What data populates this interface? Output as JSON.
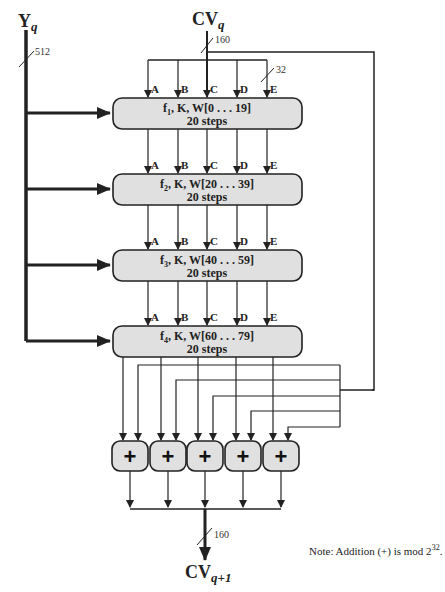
{
  "diagram": {
    "inputs": {
      "message_block": {
        "label": "Y",
        "subscript": "q",
        "width": "512"
      },
      "chaining_in": {
        "label": "CV",
        "subscript": "q",
        "width": "160"
      }
    },
    "register_width": "32",
    "registers": [
      "A",
      "B",
      "C",
      "D",
      "E"
    ],
    "rounds": [
      {
        "func": "f",
        "sub": "1",
        "rest": ", K, W[0 . . . 19]",
        "steps": "20 steps"
      },
      {
        "func": "f",
        "sub": "2",
        "rest": ", K, W[20 . . . 39]",
        "steps": "20 steps"
      },
      {
        "func": "f",
        "sub": "3",
        "rest": ", K, W[40 . . . 59]",
        "steps": "20 steps"
      },
      {
        "func": "f",
        "sub": "4",
        "rest": ", K, W[60 . . . 79]",
        "steps": "20 steps"
      }
    ],
    "adders": [
      "+",
      "+",
      "+",
      "+",
      "+"
    ],
    "output": {
      "label": "CV",
      "subscript": "q+1",
      "width": "160"
    },
    "note": {
      "text": "Note:  Addition (+) is mod 2",
      "sup": "32",
      "end": "."
    }
  },
  "colors": {
    "box_fill": "#e0e0e0",
    "stroke": "#222222",
    "background": "#ffffff"
  }
}
